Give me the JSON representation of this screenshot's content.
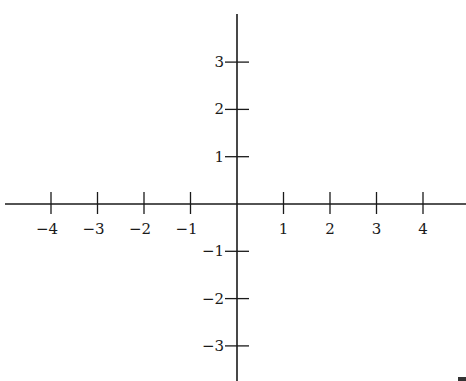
{
  "diagram": {
    "type": "cartesian-axes",
    "x_axis": {
      "ticks": [
        -4,
        -3,
        -2,
        -1,
        1,
        2,
        3,
        4
      ],
      "labels": [
        "−4",
        "−3",
        "−2",
        "−1",
        "1",
        "2",
        "3",
        "4"
      ]
    },
    "y_axis": {
      "ticks": [
        3,
        2,
        1,
        -1,
        -2,
        -3
      ],
      "labels": [
        "3",
        "2",
        "1",
        "−1",
        "−2",
        "−3"
      ]
    },
    "colors": {
      "line": "#1a1a1a",
      "background": "#ffffff"
    }
  },
  "layout": {
    "origin": {
      "x": 237,
      "y": 204
    },
    "unit_x": 46.5,
    "unit_y": 47.3,
    "x_axis_extent": [
      5,
      466
    ],
    "y_axis_extent": [
      14,
      381
    ]
  }
}
